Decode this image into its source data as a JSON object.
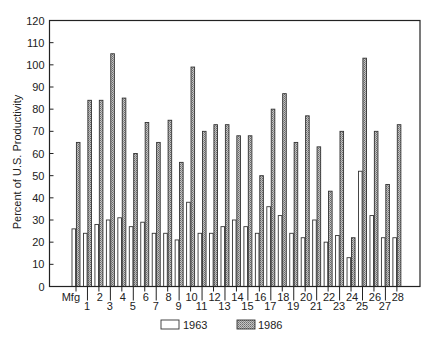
{
  "chart_data": {
    "type": "bar",
    "title": "",
    "xlabel": "",
    "ylabel": "Percent of U.S. Productivity",
    "ylim": [
      0,
      120
    ],
    "yticks": [
      0,
      10,
      20,
      30,
      40,
      50,
      60,
      70,
      80,
      90,
      100,
      110,
      120
    ],
    "grid": false,
    "legend_position": "bottom",
    "categories": [
      "Mfg",
      "1",
      "2",
      "3",
      "4",
      "5",
      "6",
      "7",
      "8",
      "9",
      "10",
      "11",
      "12",
      "13",
      "14",
      "15",
      "16",
      "17",
      "18",
      "19",
      "20",
      "21",
      "22",
      "23",
      "24",
      "25",
      "26",
      "27",
      "28"
    ],
    "series": [
      {
        "name": "1963",
        "fill": "white",
        "values": [
          26,
          24,
          28,
          30,
          31,
          27,
          29,
          24,
          24,
          21,
          38,
          24,
          24,
          27,
          30,
          27,
          24,
          36,
          32,
          24,
          22,
          30,
          20,
          23,
          13,
          52,
          32,
          22,
          22
        ]
      },
      {
        "name": "1986",
        "fill": "hatched-gray",
        "values": [
          65,
          84,
          84,
          105,
          85,
          60,
          74,
          65,
          75,
          56,
          99,
          70,
          73,
          73,
          68,
          68,
          50,
          80,
          87,
          65,
          77,
          63,
          43,
          70,
          22,
          103,
          70,
          46,
          73
        ]
      }
    ]
  },
  "colors": {
    "frame": "#222222",
    "bar_outline": "#333333",
    "hatch_fill": "#b8b8b8",
    "hatch_dot": "#6a6a6a"
  },
  "legend": {
    "items": [
      {
        "label": "1963"
      },
      {
        "label": "1986"
      }
    ]
  }
}
